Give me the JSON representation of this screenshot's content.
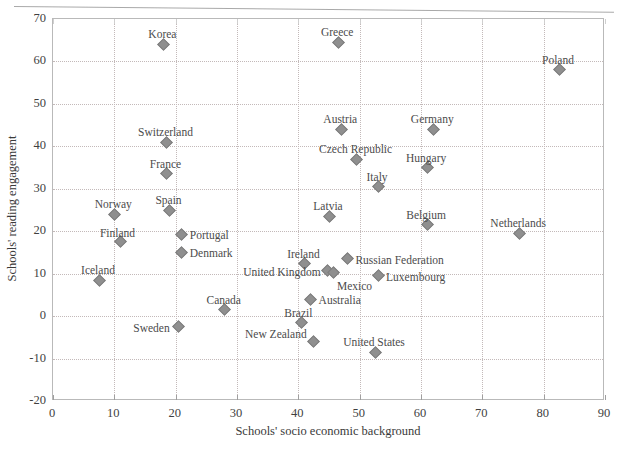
{
  "chart_data": {
    "type": "scatter",
    "title": "",
    "xlabel": "Schools' socio economic background",
    "ylabel": "Schools' reading engagement",
    "xlim": [
      0,
      90
    ],
    "ylim": [
      -20,
      70
    ],
    "xticks": [
      "0",
      "10",
      "20",
      "30",
      "40",
      "50",
      "60",
      "70",
      "80",
      "90"
    ],
    "yticks": [
      "-20",
      "-10",
      "0",
      "10",
      "20",
      "30",
      "40",
      "50",
      "60",
      "70"
    ],
    "grid": true,
    "legend": "none",
    "marker": "diamond",
    "marker_color": "#8f8f8f",
    "points": [
      {
        "label": "Korea",
        "x": 18.0,
        "y": 64.0,
        "lx": 0,
        "ly": -14,
        "align": "c"
      },
      {
        "label": "Greece",
        "x": 46.5,
        "y": 64.5,
        "lx": 0,
        "ly": -14,
        "align": "c"
      },
      {
        "label": "Poland",
        "x": 82.5,
        "y": 58.0,
        "lx": 0,
        "ly": -14,
        "align": "c"
      },
      {
        "label": "Switzerland",
        "x": 18.5,
        "y": 41.0,
        "lx": 0,
        "ly": -14,
        "align": "c"
      },
      {
        "label": "Austria",
        "x": 47.0,
        "y": 44.0,
        "lx": 0,
        "ly": -14,
        "align": "c"
      },
      {
        "label": "Germany",
        "x": 62.0,
        "y": 44.0,
        "lx": 0,
        "ly": -14,
        "align": "c"
      },
      {
        "label": "Czech Republic",
        "x": 49.5,
        "y": 37.0,
        "lx": 0,
        "ly": -14,
        "align": "c"
      },
      {
        "label": "Hungary",
        "x": 61.0,
        "y": 35.0,
        "lx": 0,
        "ly": -14,
        "align": "c"
      },
      {
        "label": "France",
        "x": 18.5,
        "y": 33.5,
        "lx": 0,
        "ly": -14,
        "align": "c"
      },
      {
        "label": "Italy",
        "x": 53.0,
        "y": 30.5,
        "lx": 0,
        "ly": -14,
        "align": "c"
      },
      {
        "label": "Norway",
        "x": 10.0,
        "y": 24.0,
        "lx": 0,
        "ly": -14,
        "align": "c"
      },
      {
        "label": "Spain",
        "x": 19.0,
        "y": 25.0,
        "lx": 0,
        "ly": -14,
        "align": "c"
      },
      {
        "label": "Latvia",
        "x": 45.0,
        "y": 23.5,
        "lx": 0,
        "ly": -14,
        "align": "c"
      },
      {
        "label": "Belgium",
        "x": 61.0,
        "y": 21.5,
        "lx": 0,
        "ly": -14,
        "align": "c"
      },
      {
        "label": "Netherlands",
        "x": 76.0,
        "y": 19.5,
        "lx": 0,
        "ly": -14,
        "align": "c"
      },
      {
        "label": "Finland",
        "x": 11.0,
        "y": 17.5,
        "lx": -2,
        "ly": -13,
        "align": "c"
      },
      {
        "label": "Portugal",
        "x": 21.0,
        "y": 19.3,
        "lx": 9,
        "ly": -3,
        "align": "l"
      },
      {
        "label": "Denmark",
        "x": 21.0,
        "y": 15.0,
        "lx": 9,
        "ly": -3,
        "align": "l"
      },
      {
        "label": "Ireland",
        "x": 41.0,
        "y": 12.3,
        "lx": 0,
        "ly": -14,
        "align": "c"
      },
      {
        "label": "Russian Federation",
        "x": 48.0,
        "y": 13.5,
        "lx": 9,
        "ly": -3,
        "align": "l"
      },
      {
        "label": "United Kingdom",
        "x": 44.8,
        "y": 10.8,
        "lx": -6,
        "ly": -2,
        "align": "r"
      },
      {
        "label": "Mexico",
        "x": 45.8,
        "y": 10.2,
        "lx": 4,
        "ly": 9,
        "align": "l"
      },
      {
        "label": "Luxembourg",
        "x": 53.0,
        "y": 9.5,
        "lx": 9,
        "ly": -3,
        "align": "l"
      },
      {
        "label": "Iceland",
        "x": 7.5,
        "y": 8.5,
        "lx": 0,
        "ly": -14,
        "align": "c"
      },
      {
        "label": "Australia",
        "x": 42.0,
        "y": 4.0,
        "lx": 9,
        "ly": -3,
        "align": "l"
      },
      {
        "label": "Canada",
        "x": 28.0,
        "y": 1.5,
        "lx": 0,
        "ly": -14,
        "align": "c"
      },
      {
        "label": "Brazil",
        "x": 40.5,
        "y": -1.5,
        "lx": -2,
        "ly": -13,
        "align": "c"
      },
      {
        "label": "Sweden",
        "x": 20.5,
        "y": -2.5,
        "lx": -8,
        "ly": -3,
        "align": "r"
      },
      {
        "label": "New Zealand",
        "x": 42.5,
        "y": -6.0,
        "lx": -6,
        "ly": -12,
        "align": "r"
      },
      {
        "label": "United States",
        "x": 52.5,
        "y": -8.5,
        "lx": 0,
        "ly": -14,
        "align": "c"
      }
    ]
  },
  "caption": ""
}
